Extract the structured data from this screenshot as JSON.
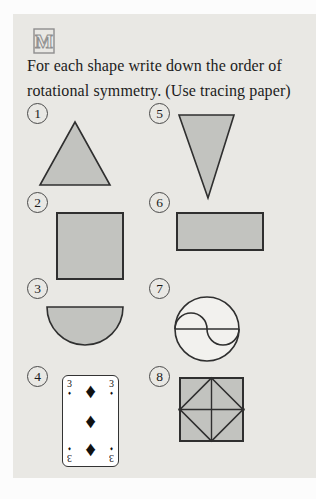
{
  "logo": {
    "letter": "M"
  },
  "instruction": {
    "line1": "For each shape write down the order of",
    "line2": "rotational symmetry. (Use tracing paper)"
  },
  "items": [
    {
      "number": "1",
      "shape": "equilateral-triangle"
    },
    {
      "number": "2",
      "shape": "square"
    },
    {
      "number": "3",
      "shape": "semicircle-flat-top"
    },
    {
      "number": "4",
      "shape": "playing-card-three-of-diamonds"
    },
    {
      "number": "5",
      "shape": "inverted-narrow-triangle"
    },
    {
      "number": "6",
      "shape": "rectangle"
    },
    {
      "number": "7",
      "shape": "circle-with-s-curve-and-diameter"
    },
    {
      "number": "8",
      "shape": "square-with-inscribed-diamond-and-midlines"
    }
  ],
  "card": {
    "rank": "3",
    "pip": "♦"
  },
  "colors": {
    "outer_background": "#fcfcfc",
    "page_background": "#e9e8e4",
    "shape_fill": "#c2c3bf",
    "shape_stroke": "#2f2f2f",
    "text": "#1c1c1c",
    "circle_outline": "#4a4a4a",
    "card_background": "#ffffff",
    "pip_black": "#111111",
    "logo_gray": "#8e8e8e"
  }
}
